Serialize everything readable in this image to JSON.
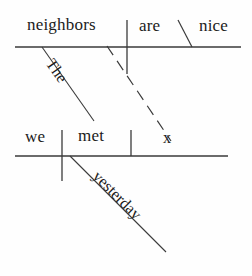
{
  "diagram": {
    "type": "reed-kellogg-sentence-diagram",
    "ink_color": "#1b1b1b",
    "background_color": "#fefefe",
    "clauses": [
      {
        "name": "main-clause",
        "subject": "neighbors",
        "verb": "are",
        "complement": "nice",
        "modifiers": [
          {
            "word": "The",
            "attaches_to": "neighbors"
          }
        ]
      },
      {
        "name": "relative-clause",
        "subject": "we",
        "verb": "met",
        "object": "x",
        "modifiers": [
          {
            "word": "yesterday",
            "attaches_to": "met"
          }
        ]
      }
    ],
    "words": {
      "neighbors": "neighbors",
      "are": "are",
      "nice": "nice",
      "the": "The",
      "we": "we",
      "met": "met",
      "x": "x",
      "yesterday": "yesterday"
    },
    "connector": {
      "name": "dashed-relative-link",
      "style": "dashed",
      "from": "x",
      "to": "neighbors"
    }
  }
}
